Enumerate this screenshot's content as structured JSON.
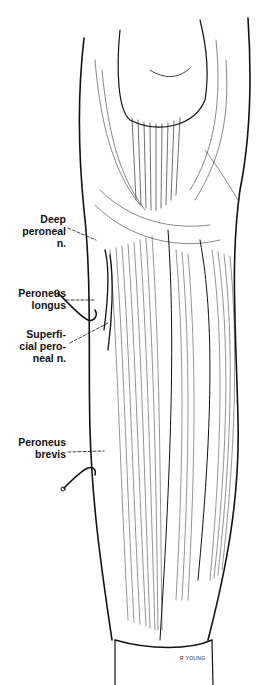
{
  "figure": {
    "labels": [
      {
        "id": "deep_peroneal_n",
        "lines": [
          "Deep",
          "peroneal",
          "n."
        ]
      },
      {
        "id": "peroneus_longus",
        "lines": [
          "Peroneus",
          "longus"
        ]
      },
      {
        "id": "superficial_peroneal_n",
        "lines": [
          "Superfi-",
          "cial pero-",
          "neal n."
        ]
      },
      {
        "id": "peroneus_brevis",
        "lines": [
          "Peroneus",
          "brevis"
        ]
      }
    ],
    "signature": "R YOUNG"
  }
}
